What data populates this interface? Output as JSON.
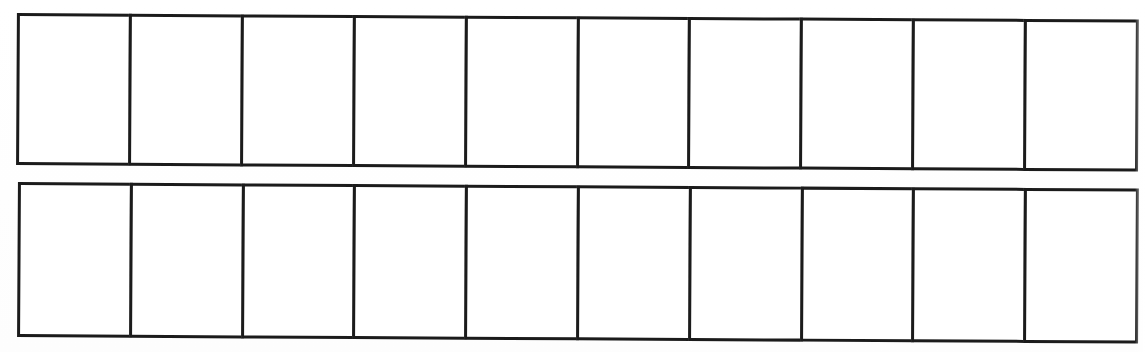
{
  "document": {
    "kind": "scanned-worksheet",
    "description": "Blank two-row grid of empty rectangular boxes on white paper",
    "background_color": "#ffffff",
    "ink_color": "#1b1b1b",
    "line_thickness_px": 3,
    "scan_skew_degrees": 0.33,
    "rows_count": 2,
    "columns_count": 10
  },
  "grid": {
    "rows": [
      {
        "name": "row-1",
        "left": 17,
        "top": 13,
        "width": 1122,
        "height": 152,
        "cells": [
          {
            "label": ""
          },
          {
            "label": ""
          },
          {
            "label": ""
          },
          {
            "label": ""
          },
          {
            "label": ""
          },
          {
            "label": ""
          },
          {
            "label": ""
          },
          {
            "label": ""
          },
          {
            "label": ""
          },
          {
            "label": ""
          }
        ]
      },
      {
        "name": "row-2",
        "left": 19,
        "top": 182,
        "width": 1121,
        "height": 155,
        "cells": [
          {
            "label": ""
          },
          {
            "label": ""
          },
          {
            "label": ""
          },
          {
            "label": ""
          },
          {
            "label": ""
          },
          {
            "label": ""
          },
          {
            "label": ""
          },
          {
            "label": ""
          },
          {
            "label": ""
          },
          {
            "label": ""
          }
        ]
      }
    ]
  }
}
